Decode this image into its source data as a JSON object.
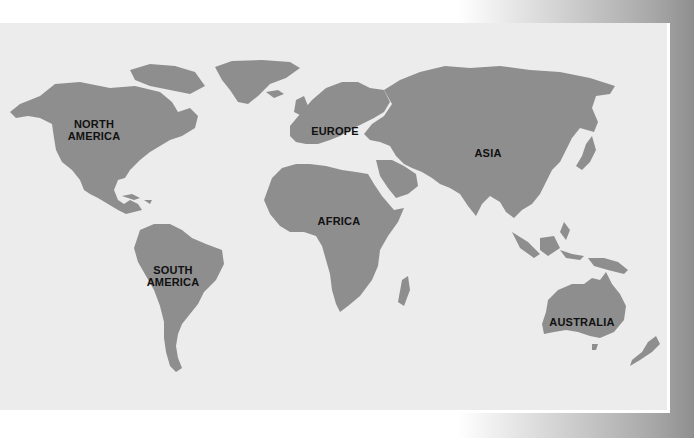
{
  "map": {
    "title": "World continents map",
    "colors": {
      "land": "#8e8e8e",
      "ocean": "#ececec",
      "label": "#111111",
      "frame": "#ffffff"
    },
    "labels": [
      {
        "id": "north-america",
        "text": "NORTH\nAMERICA",
        "x": 94,
        "y": 107
      },
      {
        "id": "europe",
        "text": "EUROPE",
        "x": 335,
        "y": 108
      },
      {
        "id": "asia",
        "text": "ASIA",
        "x": 488,
        "y": 130
      },
      {
        "id": "africa",
        "text": "AFRICA",
        "x": 339,
        "y": 198
      },
      {
        "id": "south-america",
        "text": "SOUTH\nAMERICA",
        "x": 173,
        "y": 253
      },
      {
        "id": "australia",
        "text": "AUSTRALIA",
        "x": 582,
        "y": 299
      }
    ]
  }
}
